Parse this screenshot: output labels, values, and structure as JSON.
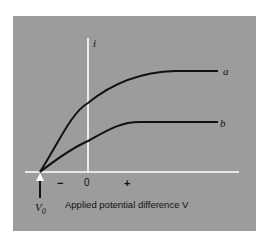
{
  "figure": {
    "y_axis_label": "i",
    "x_axis_label": "Applied potential difference V",
    "tick_minus": "−",
    "tick_zero": "0",
    "tick_plus": "+",
    "v0_label": "V",
    "v0_subscript": "0",
    "curve_a_label": "a",
    "curve_b_label": "b"
  },
  "colors": {
    "background": "#9c9c9c",
    "axes": "#ffffff",
    "curves": "#111111"
  }
}
